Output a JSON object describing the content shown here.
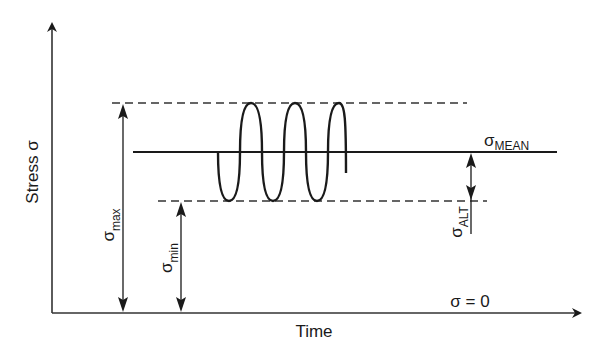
{
  "figure": {
    "type": "fluctuating-stress-cycle",
    "colors": {
      "ink": "#1a1a1a",
      "axis": "#333333",
      "background": "#ffffff"
    }
  },
  "axes": {
    "y_label": "Stress σ",
    "x_label": "Time",
    "zero_label": "σ = 0"
  },
  "levels": {
    "max": {
      "symbol": "σ",
      "subscript": "max"
    },
    "min": {
      "symbol": "σ",
      "subscript": "min"
    },
    "mean": {
      "symbol": "σ",
      "subscript": "MEAN"
    },
    "alt": {
      "symbol": "σ",
      "subscript": "ALT"
    }
  },
  "waveform": {
    "cycles": 3.5,
    "description": "sinusoidal stress oscillating between σmin and σmax about σmean"
  }
}
